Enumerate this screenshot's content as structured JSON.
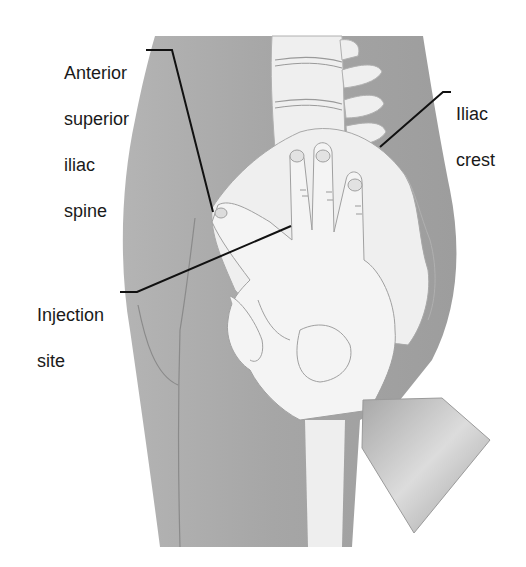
{
  "figure": {
    "colors": {
      "background": "#ffffff",
      "body": "#a9a9a9",
      "body_shade": "#9a9a9a",
      "bone": "#efefef",
      "hand": "#f3f3f3",
      "outline": "#8a8a8a",
      "sleeve": "#b8b8b8",
      "leader": "#111111",
      "text": "#1a1a1a"
    }
  },
  "labels": [
    {
      "id": "asis",
      "lines": [
        "Anterior",
        "superior",
        "iliac",
        "spine"
      ]
    },
    {
      "id": "crest",
      "lines": [
        "Iliac",
        "crest"
      ]
    },
    {
      "id": "injection",
      "lines": [
        "Injection",
        "site"
      ]
    }
  ]
}
